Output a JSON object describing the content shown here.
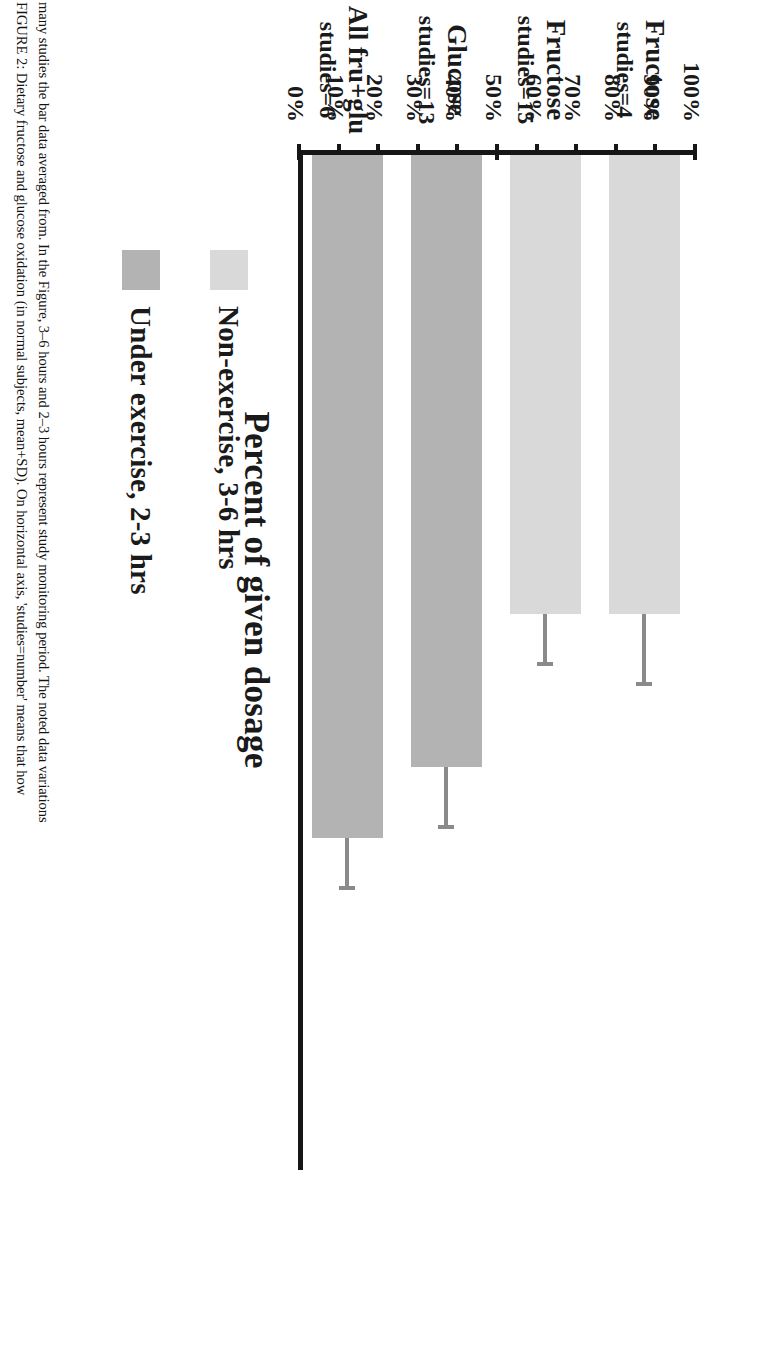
{
  "caption": {
    "figure_number": "FIGURE 2:",
    "line1": "FIGURE 2: Dietary fructose and glucose oxidation (in normal subjects, mean+SD). On horizontal axis, 'studies=number' means that how",
    "line2": "many studies the bar data averaged from. In the Figure, 3–6 hours and 2–3 hours represent study monitoring period. The noted data variations"
  },
  "chart_data": {
    "type": "bar",
    "title": "Percent of given dosage",
    "xlabel": "",
    "ylabel": "Percent of given dosage",
    "ylim": [
      0,
      100
    ],
    "grid": false,
    "legend_position": "right",
    "categories": [
      "Fructose",
      "Fructose",
      "Glucose",
      "All fru+glu"
    ],
    "category_sublabels": [
      "studies=4",
      "studies=15",
      "studies=13",
      "studies=6"
    ],
    "values": [
      45,
      45,
      60,
      67
    ],
    "errors": [
      7,
      5,
      6,
      5
    ],
    "series_of_bar": [
      "Non-exercise, 3-6 hrs",
      "Non-exercise, 3-6 hrs",
      "Under exercise, 2-3 hrs",
      "Under exercise, 2-3 hrs"
    ],
    "tick_labels": [
      "0%",
      "10%",
      "20%",
      "30%",
      "40%",
      "50%",
      "60%",
      "70%",
      "80%",
      "90%",
      "100%"
    ],
    "tick_values": [
      0,
      10,
      20,
      30,
      40,
      50,
      60,
      70,
      80,
      90,
      100
    ],
    "legend": [
      {
        "label": "Non-exercise, 3-6 hrs",
        "color": "#d9d9d9"
      },
      {
        "label": "Under exercise, 2-3 hrs",
        "color": "#b3b3b3"
      }
    ],
    "colors": {
      "non_exercise": "#d9d9d9",
      "under_exercise": "#b3b3b3",
      "axis": "#161616",
      "error_bar": "#8a8a8a"
    }
  }
}
